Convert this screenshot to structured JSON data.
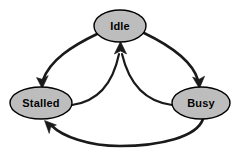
{
  "diagram": {
    "type": "state-transition-diagram",
    "background_color": "#ffffff",
    "node_fill_color": "#bdbdbd",
    "node_stroke_color": "#000000",
    "edge_color": "#1a1a1a",
    "label_color": "#000000",
    "nodes": [
      {
        "id": "idle",
        "label": "Idle",
        "shape": "ellipse",
        "cx": 120,
        "cy": 26,
        "rx": 26,
        "ry": 16
      },
      {
        "id": "stalled",
        "label": "Stalled",
        "shape": "ellipse",
        "cx": 41,
        "cy": 103,
        "rx": 31,
        "ry": 16
      },
      {
        "id": "busy",
        "label": "Busy",
        "shape": "ellipse",
        "cx": 201,
        "cy": 103,
        "rx": 29,
        "ry": 16
      }
    ],
    "edges": [
      {
        "id": "idle-to-stalled",
        "from": "idle",
        "to": "stalled",
        "label": "",
        "direction": "directed"
      },
      {
        "id": "idle-to-busy",
        "from": "idle",
        "to": "busy",
        "label": "",
        "direction": "directed"
      },
      {
        "id": "stalled-to-idle",
        "from": "stalled",
        "to": "idle",
        "label": "",
        "direction": "directed"
      },
      {
        "id": "busy-to-idle",
        "from": "busy",
        "to": "idle",
        "label": "",
        "direction": "directed"
      },
      {
        "id": "busy-to-stalled",
        "from": "busy",
        "to": "stalled",
        "label": "",
        "direction": "directed"
      }
    ]
  }
}
